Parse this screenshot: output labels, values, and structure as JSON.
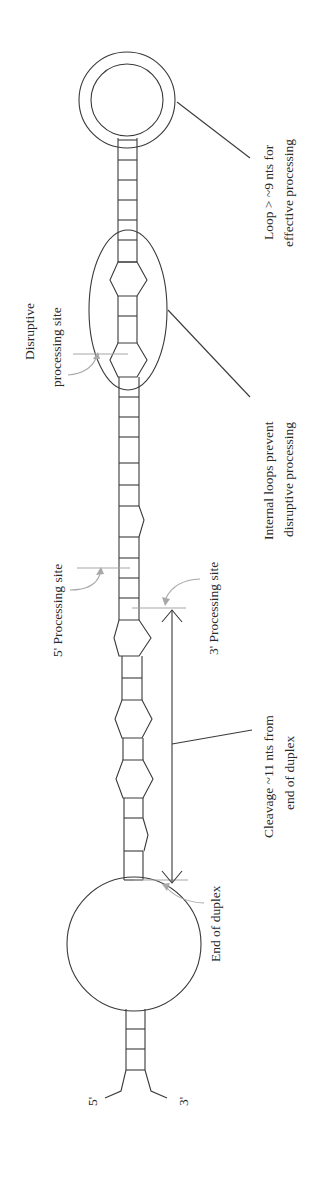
{
  "diagram": {
    "orientation": "rotated 90° counter-clockwise",
    "labels": {
      "loop_line1": "Loop > ~9 nts for",
      "loop_line2": "effective processing",
      "internal_line1": "Internal loops prevent",
      "internal_line2": "disruptive processing",
      "disruptive_line1": "Disruptive",
      "disruptive_line2": "processing site",
      "five_prime_site": "5' Processing site",
      "three_prime_site": "3' Processing site",
      "cleavage_line1": "Cleavage ~11 nts from",
      "cleavage_line2": "end of duplex",
      "end_of_duplex": "End of duplex",
      "five_prime_end": "5'",
      "three_prime_end": "3'"
    },
    "colors": {
      "line": "#3a3a3a",
      "pointer_gray": "#a8a8a8",
      "background": "#ffffff"
    }
  }
}
